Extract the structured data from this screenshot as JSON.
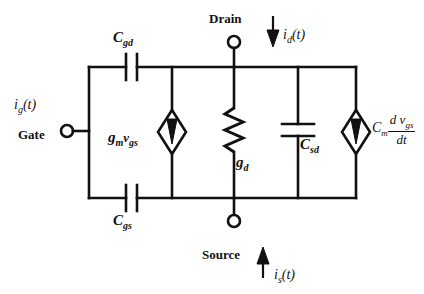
{
  "diagram": {
    "background_color": "#ffffff",
    "line_color": "#111111"
  },
  "terminals": {
    "gate": {
      "name": "Gate",
      "current_symbol": "i",
      "current_subscript": "g",
      "current_arg": "(t)"
    },
    "drain": {
      "name": "Drain",
      "current_symbol": "i",
      "current_subscript": "d",
      "current_arg": "(t)",
      "arrow_direction": "down"
    },
    "source": {
      "name": "Source",
      "current_symbol": "i",
      "current_subscript": "s",
      "current_arg": "(t)",
      "arrow_direction": "up"
    }
  },
  "components": [
    {
      "id": "cgd",
      "type": "capacitor",
      "label_symbol": "C",
      "label_subscript": "gd",
      "orientation": "vertical-plates"
    },
    {
      "id": "cgs",
      "type": "capacitor",
      "label_symbol": "C",
      "label_subscript": "gs",
      "orientation": "vertical-plates"
    },
    {
      "id": "gm-source",
      "type": "dependent-current-source",
      "label_symbol": "g",
      "label_subscript": "m",
      "label_symbol2": "v",
      "label_subscript2": "gs",
      "arrow_direction": "down"
    },
    {
      "id": "gd",
      "type": "resistor",
      "label_symbol": "g",
      "label_subscript": "d"
    },
    {
      "id": "csd",
      "type": "capacitor",
      "label_symbol": "C",
      "label_subscript": "sd",
      "orientation": "horizontal-plates"
    },
    {
      "id": "cm-source",
      "type": "dependent-current-source",
      "label_symbol": "C",
      "label_subscript": "m",
      "numerator_d": "d",
      "numerator_v": "v",
      "numerator_sub": "gs",
      "denominator": "dt",
      "arrow_direction": "down"
    }
  ]
}
